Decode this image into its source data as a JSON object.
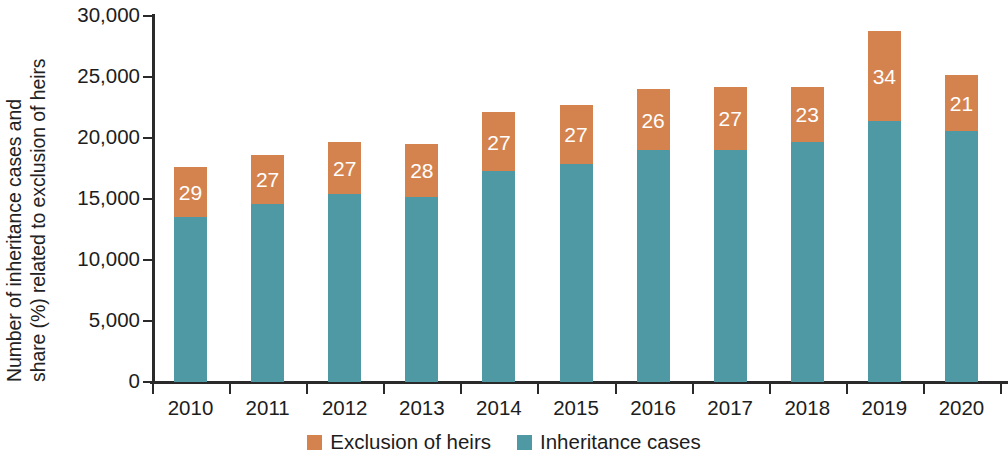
{
  "chart_data": {
    "type": "bar",
    "subtype": "stacked-bar",
    "title": "",
    "xlabel": "",
    "ylabel": "Number of inheritance cases and share (%) related to exclusion of heirs",
    "ylabel_lines": [
      "Number of inheritance cases and",
      "share (%) related to exclusion of heirs"
    ],
    "ylim": [
      0,
      30000
    ],
    "ytick_values": [
      0,
      5000,
      10000,
      15000,
      20000,
      25000,
      30000
    ],
    "ytick_labels": [
      "0",
      "5,000",
      "10,000",
      "15,000",
      "20,000",
      "25,000",
      "30,000"
    ],
    "grid": false,
    "legend_position": "bottom-center",
    "categories": [
      "2010",
      "2011",
      "2012",
      "2013",
      "2014",
      "2015",
      "2016",
      "2017",
      "2018",
      "2019",
      "2020"
    ],
    "series": [
      {
        "name": "Inheritance cases",
        "color": "#4e99a3",
        "stack_order": 1,
        "values": [
          13500,
          14600,
          15400,
          15200,
          17300,
          17900,
          19000,
          19000,
          19700,
          21400,
          20600
        ]
      },
      {
        "name": "Exclusion of heirs",
        "color": "#d5834e",
        "stack_order": 2,
        "values": [
          4100,
          4000,
          4300,
          4300,
          4800,
          4800,
          5000,
          5200,
          4500,
          7400,
          4600
        ]
      }
    ],
    "totals": [
      17600,
      18600,
      19700,
      19500,
      22100,
      22700,
      24000,
      24200,
      24200,
      28800,
      25200
    ],
    "data_labels": {
      "series": "Exclusion of heirs",
      "unit": "%",
      "values": [
        29,
        27,
        27,
        28,
        27,
        27,
        26,
        27,
        23,
        34,
        21
      ],
      "text": [
        "29",
        "27",
        "27",
        "28",
        "27",
        "27",
        "26",
        "27",
        "23",
        "34",
        "21"
      ]
    }
  },
  "legend": {
    "items": [
      {
        "label": "Exclusion of heirs",
        "color": "#d5834e"
      },
      {
        "label": "Inheritance cases",
        "color": "#4e99a3"
      }
    ]
  },
  "colors": {
    "exclusion_of_heirs": "#d5834e",
    "inheritance_cases": "#4e99a3",
    "axis": "#2a2a2a",
    "text": "#1d1d1d",
    "background": "#ffffff",
    "data_label_text": "#ffffff"
  }
}
